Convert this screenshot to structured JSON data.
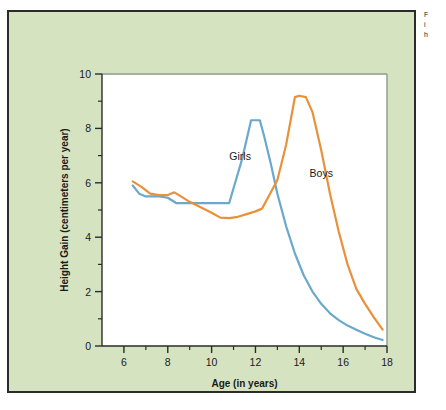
{
  "figure": {
    "background_color": "#d6e3c1",
    "border_color": "#2b2b2b",
    "plot_background_color": "#ffffff"
  },
  "caption": {
    "lines": [
      "F",
      "i",
      "h"
    ]
  },
  "chart_data": {
    "type": "line",
    "title": "",
    "xlabel": "Age (in years)",
    "ylabel": "Height Gain (centimeters per year)",
    "xlim": [
      5,
      18
    ],
    "ylim": [
      0,
      10
    ],
    "xticks": [
      6,
      8,
      10,
      12,
      14,
      16,
      18
    ],
    "xtick_labels": [
      "6",
      "8",
      "10",
      "12",
      "14",
      "16",
      "18"
    ],
    "xminor_ticks": [
      7,
      9,
      11,
      13,
      15,
      17
    ],
    "yticks": [
      0,
      2,
      4,
      6,
      8,
      10
    ],
    "ytick_labels": [
      "0",
      "2",
      "4",
      "6",
      "8",
      "10"
    ],
    "yminor_ticks": [
      1,
      3,
      5,
      7,
      9
    ],
    "grid": false,
    "legend": "inline-labels",
    "series": [
      {
        "name": "Girls",
        "color": "#6aa8cc",
        "label_x": 11.3,
        "label_y": 6.85,
        "x": [
          6.4,
          6.7,
          7.0,
          7.3,
          7.6,
          8.0,
          8.4,
          9.0,
          9.5,
          10.0,
          10.4,
          10.8,
          11.0,
          11.4,
          11.8,
          12.0,
          12.2,
          12.4,
          12.7,
          13.0,
          13.4,
          13.8,
          14.2,
          14.6,
          15.0,
          15.4,
          15.8,
          16.2,
          16.6,
          17.0,
          17.4,
          17.8
        ],
        "y": [
          5.9,
          5.6,
          5.5,
          5.5,
          5.5,
          5.45,
          5.25,
          5.25,
          5.25,
          5.25,
          5.25,
          5.25,
          5.8,
          6.9,
          8.3,
          8.3,
          8.3,
          7.7,
          6.7,
          5.6,
          4.4,
          3.4,
          2.6,
          2.0,
          1.55,
          1.2,
          0.95,
          0.75,
          0.6,
          0.45,
          0.32,
          0.22
        ]
      },
      {
        "name": "Boys",
        "color": "#e8913a",
        "label_x": 15.0,
        "label_y": 6.2,
        "x": [
          6.4,
          6.8,
          7.2,
          7.6,
          8.0,
          8.3,
          8.6,
          9.0,
          9.5,
          10.0,
          10.4,
          10.8,
          11.2,
          11.6,
          12.0,
          12.3,
          12.6,
          13.0,
          13.4,
          13.8,
          14.0,
          14.3,
          14.6,
          15.0,
          15.4,
          15.8,
          16.2,
          16.6,
          17.0,
          17.4,
          17.8
        ],
        "y": [
          6.05,
          5.85,
          5.6,
          5.55,
          5.55,
          5.65,
          5.5,
          5.3,
          5.1,
          4.9,
          4.72,
          4.7,
          4.75,
          4.85,
          4.95,
          5.05,
          5.5,
          6.1,
          7.4,
          9.15,
          9.2,
          9.15,
          8.6,
          7.2,
          5.6,
          4.2,
          3.0,
          2.1,
          1.55,
          1.05,
          0.6
        ]
      }
    ]
  }
}
